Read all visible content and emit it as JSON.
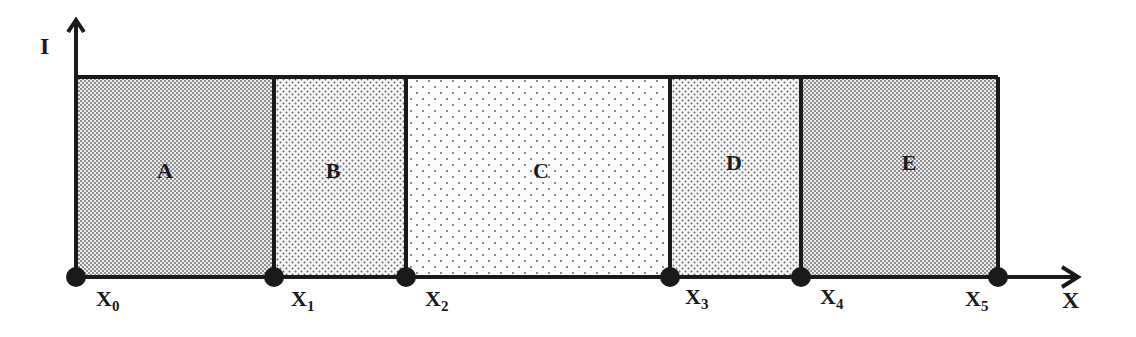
{
  "diagram": {
    "y_axis_label": "I",
    "x_axis_label": "X",
    "regions": [
      {
        "label": "A",
        "x0": 76,
        "x1": 274,
        "pattern": "dense"
      },
      {
        "label": "B",
        "x0": 274,
        "x1": 406,
        "pattern": "medium"
      },
      {
        "label": "C",
        "x0": 406,
        "x1": 670,
        "pattern": "sparse"
      },
      {
        "label": "D",
        "x0": 670,
        "x1": 801,
        "pattern": "medium"
      },
      {
        "label": "E",
        "x0": 801,
        "x1": 998,
        "pattern": "dense"
      }
    ],
    "points": [
      {
        "base": "X",
        "sub": "0"
      },
      {
        "base": "X",
        "sub": "1"
      },
      {
        "base": "X",
        "sub": "2"
      },
      {
        "base": "X",
        "sub": "3"
      },
      {
        "base": "X",
        "sub": "4"
      },
      {
        "base": "X",
        "sub": "5"
      }
    ],
    "colors": {
      "line": "#1a1a1a",
      "dot": "#777777",
      "background": "#ffffff"
    }
  }
}
